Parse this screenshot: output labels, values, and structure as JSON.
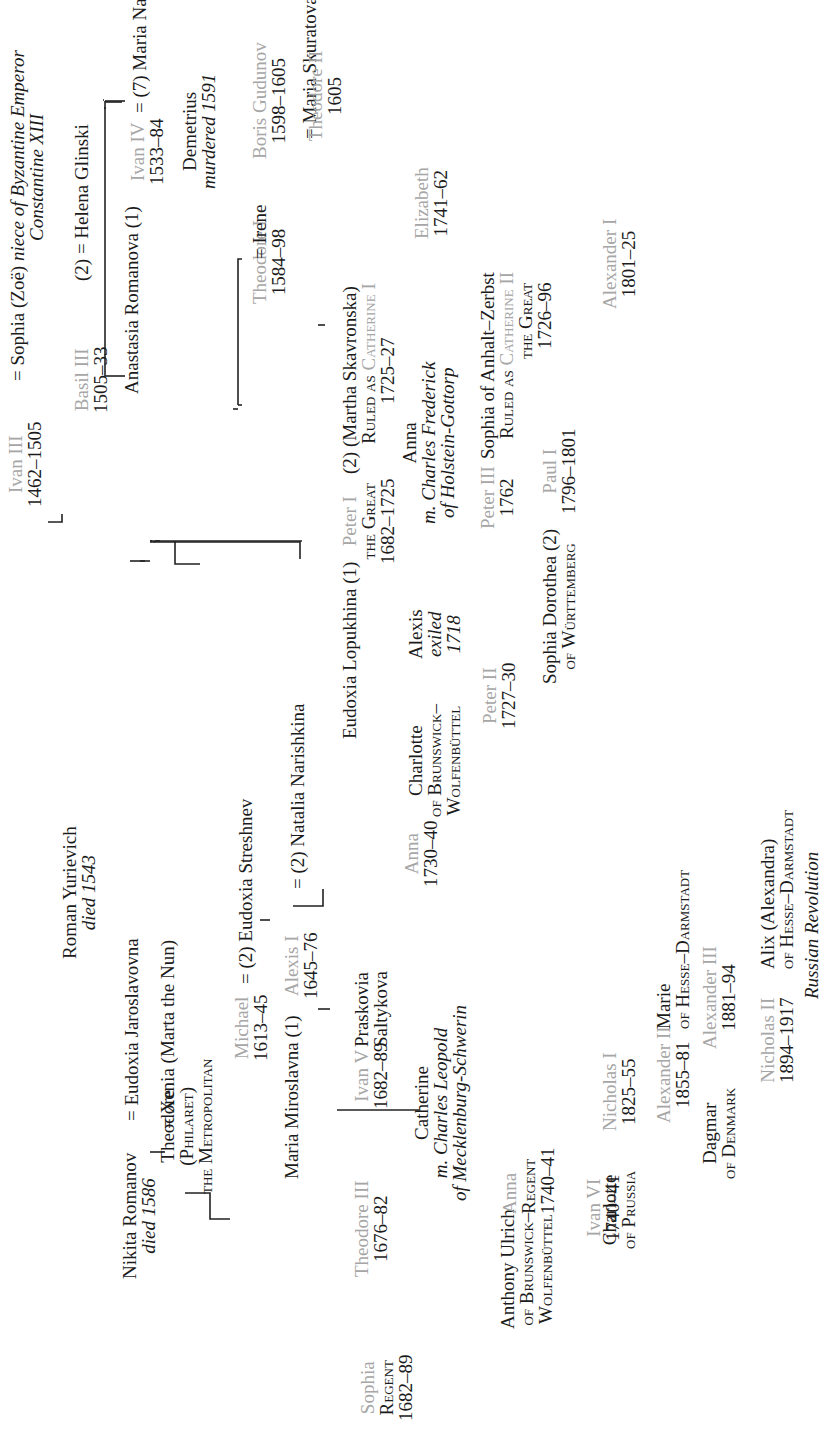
{
  "title": "Russian Tsars · 1462–1917",
  "colors": {
    "tsar": "#a6a6a6",
    "text": "#1b1b1b",
    "line": "#222222"
  },
  "people": {
    "ivan3": {
      "name": "Ivan III",
      "years": "1462–1505"
    },
    "sophia_zoe": {
      "name": "Sophia (Zoë)",
      "note1": "niece of Byzantine Emperor",
      "note2": "Constantine XIII"
    },
    "basil3": {
      "name": "Basil III",
      "years": "1505–33"
    },
    "helena": {
      "name": "(2) = Helena Glinski"
    },
    "anastasia": {
      "name": "Anastasia Romanova (1)"
    },
    "ivan4": {
      "name": "Ivan IV",
      "years": "1533–84"
    },
    "maria_nagaia": {
      "name": "(7) Maria Nagaia"
    },
    "demetrius": {
      "name": "Demetrius",
      "note": "murdered 1591"
    },
    "theodore1": {
      "name": "Theodore I",
      "years": "1584–98"
    },
    "irene": {
      "name": "Irene"
    },
    "boris": {
      "name": "Boris Gudunov",
      "years": "1598–1605"
    },
    "maria_sk": {
      "name": "Maria Skuratova"
    },
    "theodore2": {
      "name": "Theodore II",
      "years": "1605"
    },
    "roman": {
      "name": "Roman Yurievich",
      "note": "died 1543"
    },
    "nikita": {
      "name": "Nikita Romanov",
      "note": "died 1586"
    },
    "eudoxia_j": {
      "name": "Eudoxia Jaroslavovna"
    },
    "theodore_ph": {
      "name": "Theodore",
      "l2": "(Philaret)",
      "l3": "the Metropolitan"
    },
    "xenia": {
      "name": "Xenia (Marta the Nun)"
    },
    "michael": {
      "name": "Michael",
      "years": "1613–45"
    },
    "eudoxia_s": {
      "name": "(2) Eudoxia Streshnev"
    },
    "maria_m": {
      "name": "Maria Miroslavna (1)"
    },
    "alexis1": {
      "name": "Alexis I",
      "years": "1645–76"
    },
    "natalia": {
      "name": "(2) Natalia Narishkina"
    },
    "sophia_reg": {
      "name": "Sophia",
      "l2": "Regent",
      "years": "1682–89"
    },
    "theodore3": {
      "name": "Theodore III",
      "years": "1676–82"
    },
    "ivan5": {
      "name": "Ivan V",
      "years": "1682–89"
    },
    "praskovia": {
      "name": "Praskovia",
      "l2": "Saltykova"
    },
    "anna_1730": {
      "name": "Anna",
      "years": "1730–40"
    },
    "catherine_m": {
      "name": "Catherine",
      "l2": "m. Charles Leopold",
      "l3": "of Mecklenburg-Schwerin"
    },
    "anthony": {
      "name": "Anthony Ulrich",
      "l2": "of Brunswick–",
      "l3": "Wolfenbüttel"
    },
    "anna_reg": {
      "name": "Anna",
      "l2": "Regent",
      "years": "1740–41"
    },
    "ivan6": {
      "name": "Ivan VI",
      "years": "1740–41"
    },
    "eudoxia_l": {
      "name": "Eudoxia Lopukhina (1)"
    },
    "peter1": {
      "name": "Peter I",
      "l2": "the Great",
      "years": "1682–1725"
    },
    "martha": {
      "name": "(2) (Martha Skavronska)",
      "l2a": "Ruled as ",
      "l2b": "Catherine I",
      "years": "1725–27"
    },
    "elizabeth": {
      "name": "Elizabeth",
      "years": "1741–62"
    },
    "alexis_ex": {
      "name": "Alexis",
      "note1": "exiled",
      "note2": "1718"
    },
    "charlotte_b": {
      "name": "Charlotte",
      "l2": "of Brunswick–",
      "l3": "Wolfenbüttel"
    },
    "peter2": {
      "name": "Peter II",
      "years": "1727–30"
    },
    "anna_h": {
      "name": "Anna",
      "l2": "m. Charles Frederick",
      "l3": "of Holstein-Gottorp"
    },
    "peter3": {
      "name": "Peter III",
      "years": "1762"
    },
    "sophia_az": {
      "name": "Sophia of Anhalt–Zerbst",
      "l2a": "Ruled as ",
      "l2b": "Catherine II",
      "l3": "the Great",
      "years": "1726–96"
    },
    "paul1": {
      "name": "Paul I",
      "years": "1796–1801"
    },
    "sophia_d": {
      "name": "Sophia Dorothea (2)",
      "l2": "of Württemberg"
    },
    "alexander1": {
      "name": "Alexander I",
      "years": "1801–25"
    },
    "charlotte_p": {
      "name": "Charlotte",
      "l2": "of Prussia"
    },
    "nicholas1": {
      "name": "Nicholas I",
      "years": "1825–55"
    },
    "alexander2": {
      "name": "Alexander II",
      "years": "1855–81"
    },
    "marie": {
      "name": "Marie",
      "l2": "of Hesse–Darmstadt"
    },
    "dagmar": {
      "name": "Dagmar",
      "l2": "of Denmark"
    },
    "alexander3": {
      "name": "Alexander III",
      "years": "1881–94"
    },
    "nicholas2": {
      "name": "Nicholas II",
      "years": "1894–1917"
    },
    "alix": {
      "name": "Alix (Alexandra)",
      "l2": "of Hesse–Darmstadt"
    },
    "revolution": {
      "note": "Russian Revolution"
    }
  },
  "symbols": {
    "marriage": "="
  }
}
